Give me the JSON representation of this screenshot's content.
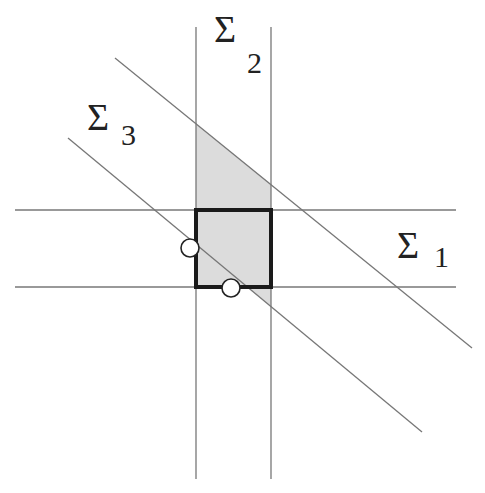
{
  "figure": {
    "type": "hyperplane-arrangement",
    "labels": [
      {
        "id": "sigma1",
        "symbol": "Σ",
        "subscript": "1",
        "describes": "horizontal line pair"
      },
      {
        "id": "sigma2",
        "symbol": "Σ",
        "subscript": "2",
        "describes": "vertical line pair"
      },
      {
        "id": "sigma3",
        "symbol": "Σ",
        "subscript": "3",
        "describes": "diagonal line pair"
      }
    ],
    "regions": {
      "shaded_region": "intersection strip of Σ2 below upper Σ3 line",
      "bold_square": "intersection of Σ1 and Σ2"
    },
    "markers": [
      {
        "id": "point-left",
        "kind": "open-circle",
        "on": "left edge of bold square / lower diagonal"
      },
      {
        "id": "point-bottom",
        "kind": "open-circle",
        "on": "bottom edge of bold square / lower diagonal"
      }
    ],
    "colors": {
      "line": "#777777",
      "bold": "#1a1a1a",
      "shade": "#dcdcdc",
      "text": "#222222"
    }
  }
}
